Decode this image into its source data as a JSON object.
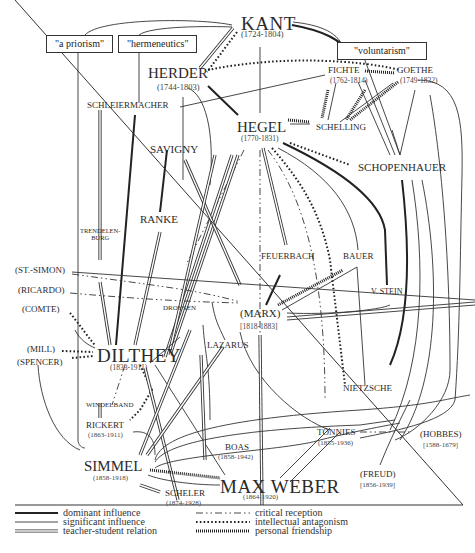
{
  "concepts": [
    {
      "id": "a_priorism",
      "label": "\"a priorism\""
    },
    {
      "id": "hermeneutics",
      "label": "\"hermeneutics\""
    },
    {
      "id": "voluntarism",
      "label": "\"voluntarism\""
    }
  ],
  "thinkers": {
    "kant": {
      "name": "KANT",
      "dates": "(1724-1804)"
    },
    "herder": {
      "name": "HERDER",
      "dates": "(1744-1803)"
    },
    "fichte": {
      "name": "FICHTE",
      "dates": "(1762-1814)"
    },
    "goethe": {
      "name": "GOETHE",
      "dates": "(1749-1832)"
    },
    "schleiermacher": {
      "name": "SCHLEIERMACHER"
    },
    "hegel": {
      "name": "HEGEL",
      "dates": "(1770-1831)"
    },
    "schelling": {
      "name": "SCHELLING"
    },
    "savigny": {
      "name": "SAVIGNY"
    },
    "schopenhauer": {
      "name": "SCHOPENHAUER"
    },
    "ranke": {
      "name": "RANKE"
    },
    "trendelenburg": {
      "name": "TRENDELEN-\nBURG"
    },
    "feuerbach": {
      "name": "FEUERBACH"
    },
    "bauer": {
      "name": "BAUER"
    },
    "st_simon": {
      "name": "(ST.-SIMON)"
    },
    "ricardo": {
      "name": "(RICARDO)"
    },
    "v_stein": {
      "name": "V. STEIN"
    },
    "comte": {
      "name": "(COMTE)"
    },
    "droysen": {
      "name": "DROYSEN"
    },
    "marx": {
      "name": "(MARX)",
      "dates": "[1818-1883]"
    },
    "mill": {
      "name": "(MILL)"
    },
    "spencer": {
      "name": "(SPENCER)"
    },
    "dilthey": {
      "name": "DILTHEY",
      "dates": "(1833-1911)"
    },
    "lazarus": {
      "name": "LAZARUS"
    },
    "nietzsche": {
      "name": "NIETZSCHE"
    },
    "windelband": {
      "name": "WINDELBAND"
    },
    "rickert": {
      "name": "RICKERT",
      "dates": "(1863-1911)"
    },
    "boas": {
      "name": "BOAS",
      "dates": "(1858-1942)"
    },
    "tonnies": {
      "name": "TÖNNIES",
      "dates": "(1855-1936)"
    },
    "hobbes": {
      "name": "(HOBBES)",
      "dates": "[1588-1679]"
    },
    "freud": {
      "name": "(FREUD)",
      "dates": "[1856-1939]"
    },
    "simmel": {
      "name": "SIMMEL",
      "dates": "(1858-1918)"
    },
    "max_weber": {
      "name": "MAX WEBER",
      "dates": "(1864-1920)"
    },
    "scheler": {
      "name": "SCHELER",
      "dates": "(1874-1928)"
    }
  },
  "legend": {
    "left": [
      {
        "style": "thick",
        "label": "dominant influence"
      },
      {
        "style": "thin",
        "label": "significant influence"
      },
      {
        "style": "double",
        "label": "teacher-student relation"
      }
    ],
    "right": [
      {
        "style": "dashdot",
        "label": "critical reception"
      },
      {
        "style": "dotted",
        "label": "intellectual antagonism"
      },
      {
        "style": "dense-dotted",
        "label": "personal friendship"
      }
    ]
  },
  "colors": {
    "ink": "#2a2a2a",
    "background": "#ffffff"
  }
}
